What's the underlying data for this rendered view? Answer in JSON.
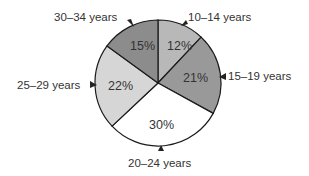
{
  "chart_data": {
    "type": "pie",
    "title": "",
    "categories": [
      "10–14 years",
      "15–19 years",
      "20–24 years",
      "25–29 years",
      "30–34 years"
    ],
    "values": [
      12,
      21,
      30,
      22,
      15
    ],
    "value_labels": [
      "12%",
      "21%",
      "30%",
      "22%",
      "15%"
    ],
    "colors": [
      "#b8b8b8",
      "#999999",
      "#ffffff",
      "#d6d6d6",
      "#8c8c8c"
    ],
    "start_angle_deg": -90,
    "direction": "clockwise",
    "legend": "none",
    "annotations": "external category labels with arrow pointers"
  },
  "labels": {
    "s0": "10–14 years",
    "s1": "15–19 years",
    "s2": "20–24 years",
    "s3": "25–29 years",
    "s4": "30–34 years",
    "p0": "12%",
    "p1": "21%",
    "p2": "30%",
    "p3": "22%",
    "p4": "15%"
  }
}
